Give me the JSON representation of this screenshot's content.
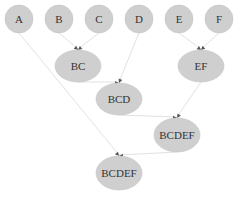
{
  "diagram": {
    "type": "merge-tree",
    "colors": {
      "node_fill": "#cfcfcf",
      "edge": "#e2e2e2",
      "arrow": "#555555",
      "text": "#333333"
    },
    "nodes": [
      {
        "id": "A",
        "label": "A",
        "cx": 19,
        "cy": 19,
        "rx": 14,
        "ry": 14
      },
      {
        "id": "B",
        "label": "B",
        "cx": 59,
        "cy": 19,
        "rx": 14,
        "ry": 14
      },
      {
        "id": "C",
        "label": "C",
        "cx": 99,
        "cy": 19,
        "rx": 14,
        "ry": 14
      },
      {
        "id": "D",
        "label": "D",
        "cx": 139,
        "cy": 19,
        "rx": 14,
        "ry": 14
      },
      {
        "id": "E",
        "label": "E",
        "cx": 179,
        "cy": 19,
        "rx": 14,
        "ry": 14
      },
      {
        "id": "F",
        "label": "F",
        "cx": 219,
        "cy": 19,
        "rx": 14,
        "ry": 14
      },
      {
        "id": "BC",
        "label": "BC",
        "cx": 78,
        "cy": 66,
        "rx": 23,
        "ry": 16
      },
      {
        "id": "EF",
        "label": "EF",
        "cx": 201,
        "cy": 66,
        "rx": 23,
        "ry": 16
      },
      {
        "id": "BCD",
        "label": "BCD",
        "cx": 119,
        "cy": 99,
        "rx": 23,
        "ry": 16
      },
      {
        "id": "BCDEF1",
        "label": "BCDEF",
        "cx": 177,
        "cy": 135,
        "rx": 23,
        "ry": 17
      },
      {
        "id": "BCDEF2",
        "label": "BCDEF",
        "cx": 119,
        "cy": 173,
        "rx": 23,
        "ry": 17
      }
    ],
    "edges": [
      {
        "from": "B",
        "to": "BC"
      },
      {
        "from": "C",
        "to": "BC"
      },
      {
        "from": "E",
        "to": "EF"
      },
      {
        "from": "F",
        "to": "EF"
      },
      {
        "from": "BC",
        "to": "BCD"
      },
      {
        "from": "D",
        "to": "BCD"
      },
      {
        "from": "BCD",
        "to": "BCDEF1"
      },
      {
        "from": "EF",
        "to": "BCDEF1"
      },
      {
        "from": "A",
        "to": "BCDEF2"
      },
      {
        "from": "BCDEF1",
        "to": "BCDEF2"
      }
    ]
  }
}
